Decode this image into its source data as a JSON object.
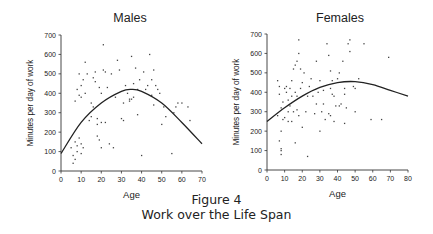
{
  "figure": {
    "number_label": "Figure 4",
    "caption": "Work over the Life Span"
  },
  "chart_data": [
    {
      "type": "scatter",
      "title": "Males",
      "xlabel": "Age",
      "ylabel": "Minutes per day of work",
      "xlim": [
        0,
        70
      ],
      "ylim": [
        0,
        700
      ],
      "xticks": [
        0,
        10,
        20,
        30,
        40,
        50,
        60,
        70
      ],
      "yticks": [
        0,
        100,
        200,
        300,
        400,
        500,
        600,
        700
      ],
      "grid": false,
      "fit_curve": {
        "type": "quadratic",
        "points": [
          [
            0,
            90
          ],
          [
            10,
            250
          ],
          [
            20,
            350
          ],
          [
            30,
            410
          ],
          [
            35,
            420
          ],
          [
            40,
            410
          ],
          [
            50,
            350
          ],
          [
            60,
            250
          ],
          [
            70,
            140
          ]
        ]
      },
      "points": [
        [
          5,
          120
        ],
        [
          6,
          40
        ],
        [
          6,
          80
        ],
        [
          7,
          150
        ],
        [
          7,
          60
        ],
        [
          8,
          130
        ],
        [
          8,
          100
        ],
        [
          9,
          170
        ],
        [
          10,
          140
        ],
        [
          10,
          90
        ],
        [
          11,
          120
        ],
        [
          7,
          360
        ],
        [
          8,
          420
        ],
        [
          9,
          390
        ],
        [
          10,
          380
        ],
        [
          12,
          400
        ],
        [
          10,
          440
        ],
        [
          12,
          560
        ],
        [
          9,
          500
        ],
        [
          11,
          470
        ],
        [
          13,
          500
        ],
        [
          14,
          260
        ],
        [
          15,
          280
        ],
        [
          15,
          350
        ],
        [
          16,
          330
        ],
        [
          16,
          480
        ],
        [
          17,
          460
        ],
        [
          17,
          510
        ],
        [
          18,
          180
        ],
        [
          18,
          270
        ],
        [
          18,
          240
        ],
        [
          19,
          160
        ],
        [
          19,
          430
        ],
        [
          20,
          250
        ],
        [
          20,
          120
        ],
        [
          20,
          400
        ],
        [
          21,
          650
        ],
        [
          21,
          520
        ],
        [
          22,
          250
        ],
        [
          22,
          510
        ],
        [
          23,
          430
        ],
        [
          24,
          140
        ],
        [
          25,
          500
        ],
        [
          26,
          120
        ],
        [
          27,
          380
        ],
        [
          28,
          570
        ],
        [
          29,
          520
        ],
        [
          30,
          270
        ],
        [
          31,
          260
        ],
        [
          31,
          350
        ],
        [
          32,
          440
        ],
        [
          33,
          400
        ],
        [
          34,
          360
        ],
        [
          34,
          370
        ],
        [
          35,
          590
        ],
        [
          35,
          370
        ],
        [
          36,
          380
        ],
        [
          36,
          450
        ],
        [
          37,
          530
        ],
        [
          38,
          420
        ],
        [
          38,
          290
        ],
        [
          39,
          470
        ],
        [
          40,
          80
        ],
        [
          41,
          510
        ],
        [
          42,
          420
        ],
        [
          43,
          440
        ],
        [
          44,
          600
        ],
        [
          45,
          390
        ],
        [
          45,
          470
        ],
        [
          46,
          520
        ],
        [
          46,
          340
        ],
        [
          47,
          440
        ],
        [
          48,
          420
        ],
        [
          49,
          400
        ],
        [
          50,
          240
        ],
        [
          51,
          330
        ],
        [
          52,
          280
        ],
        [
          55,
          90
        ],
        [
          56,
          300
        ],
        [
          57,
          330
        ],
        [
          58,
          350
        ],
        [
          60,
          350
        ],
        [
          63,
          330
        ],
        [
          64,
          260
        ]
      ]
    },
    {
      "type": "scatter",
      "title": "Females",
      "xlabel": "Age",
      "ylabel": "Minutes per day of work",
      "xlim": [
        0,
        80
      ],
      "ylim": [
        0,
        700
      ],
      "xticks": [
        0,
        10,
        20,
        30,
        40,
        50,
        60,
        70,
        80
      ],
      "yticks": [
        0,
        100,
        200,
        300,
        400,
        500,
        600,
        700
      ],
      "grid": false,
      "fit_curve": {
        "type": "quadratic",
        "points": [
          [
            0,
            250
          ],
          [
            10,
            320
          ],
          [
            20,
            380
          ],
          [
            30,
            425
          ],
          [
            40,
            450
          ],
          [
            50,
            455
          ],
          [
            60,
            440
          ],
          [
            70,
            410
          ],
          [
            80,
            380
          ]
        ]
      },
      "points": [
        [
          6,
          280
        ],
        [
          6,
          460
        ],
        [
          7,
          150
        ],
        [
          7,
          390
        ],
        [
          7,
          430
        ],
        [
          8,
          80
        ],
        [
          8,
          100
        ],
        [
          8,
          110
        ],
        [
          8,
          200
        ],
        [
          8,
          320
        ],
        [
          9,
          260
        ],
        [
          9,
          350
        ],
        [
          10,
          270
        ],
        [
          10,
          420
        ],
        [
          11,
          400
        ],
        [
          11,
          430
        ],
        [
          12,
          250
        ],
        [
          12,
          300
        ],
        [
          12,
          360
        ],
        [
          13,
          330
        ],
        [
          13,
          420
        ],
        [
          14,
          250
        ],
        [
          14,
          380
        ],
        [
          14,
          460
        ],
        [
          15,
          520
        ],
        [
          15,
          300
        ],
        [
          16,
          140
        ],
        [
          16,
          400
        ],
        [
          16,
          540
        ],
        [
          17,
          380
        ],
        [
          17,
          560
        ],
        [
          17,
          310
        ],
        [
          18,
          280
        ],
        [
          18,
          600
        ],
        [
          18,
          670
        ],
        [
          19,
          520
        ],
        [
          19,
          420
        ],
        [
          20,
          220
        ],
        [
          20,
          450
        ],
        [
          21,
          500
        ],
        [
          22,
          300
        ],
        [
          23,
          70
        ],
        [
          23,
          380
        ],
        [
          24,
          430
        ],
        [
          25,
          470
        ],
        [
          26,
          380
        ],
        [
          27,
          290
        ],
        [
          28,
          340
        ],
        [
          28,
          560
        ],
        [
          29,
          400
        ],
        [
          30,
          200
        ],
        [
          30,
          460
        ],
        [
          31,
          300
        ],
        [
          32,
          340
        ],
        [
          32,
          410
        ],
        [
          33,
          260
        ],
        [
          34,
          650
        ],
        [
          35,
          290
        ],
        [
          35,
          590
        ],
        [
          36,
          280
        ],
        [
          36,
          420
        ],
        [
          36,
          510
        ],
        [
          37,
          460
        ],
        [
          37,
          390
        ],
        [
          38,
          250
        ],
        [
          38,
          380
        ],
        [
          39,
          330
        ],
        [
          40,
          470
        ],
        [
          41,
          330
        ],
        [
          41,
          500
        ],
        [
          42,
          340
        ],
        [
          43,
          560
        ],
        [
          44,
          240
        ],
        [
          44,
          390
        ],
        [
          44,
          420
        ],
        [
          45,
          320
        ],
        [
          46,
          650
        ],
        [
          47,
          610
        ],
        [
          47,
          670
        ],
        [
          49,
          430
        ],
        [
          50,
          420
        ],
        [
          50,
          300
        ],
        [
          52,
          470
        ],
        [
          55,
          650
        ],
        [
          59,
          260
        ],
        [
          65,
          260
        ],
        [
          69,
          580
        ]
      ]
    }
  ]
}
